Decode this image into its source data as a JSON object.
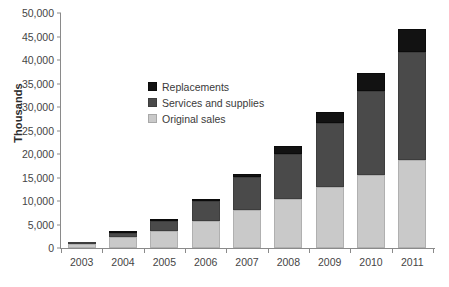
{
  "chart_data": {
    "type": "bar",
    "subtype": "stacked-vertical",
    "title": "",
    "xlabel": "",
    "ylabel": "Thousands",
    "ylim": [
      0,
      50000
    ],
    "ytick_step": 5000,
    "ytick_labels": [
      "50,000",
      "45,000",
      "40,000",
      "35,000",
      "30,000",
      "25,000",
      "20,000",
      "15,000",
      "10,000",
      "5,000",
      "0"
    ],
    "ytick_values": [
      50000,
      45000,
      40000,
      35000,
      30000,
      25000,
      20000,
      15000,
      10000,
      5000,
      0
    ],
    "grid": false,
    "legend_position": "inside-upper-left",
    "categories": [
      "2003",
      "2004",
      "2005",
      "2006",
      "2007",
      "2008",
      "2009",
      "2010",
      "2011"
    ],
    "series": [
      {
        "name": "Original sales",
        "color": "#c9c9c9",
        "values": [
          900,
          2400,
          3700,
          5700,
          8100,
          10500,
          12900,
          15600,
          18700
        ]
      },
      {
        "name": "Services and supplies",
        "color": "#4a4a4a",
        "values": [
          300,
          900,
          2000,
          4200,
          7000,
          9600,
          13600,
          17900,
          23100
        ]
      },
      {
        "name": "Replacements",
        "color": "#121212",
        "values": [
          0,
          200,
          400,
          500,
          700,
          1700,
          2400,
          3800,
          4700
        ]
      }
    ],
    "totals": [
      1200,
      3500,
      6100,
      10400,
      15800,
      21800,
      28900,
      37300,
      46500
    ],
    "legend_order": [
      "Replacements",
      "Services and supplies",
      "Original sales"
    ]
  },
  "axis": {
    "y_title": "Thousands"
  },
  "legend": {
    "items": [
      {
        "label": "Replacements"
      },
      {
        "label": "Services and supplies"
      },
      {
        "label": "Original sales"
      }
    ]
  },
  "caption": {
    "text": ""
  }
}
